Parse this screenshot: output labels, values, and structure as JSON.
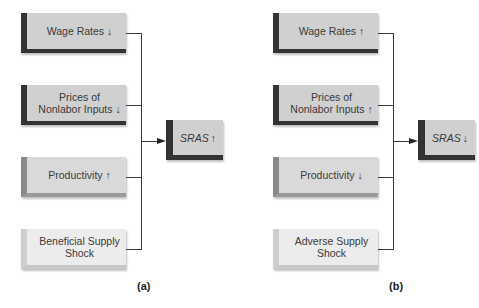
{
  "panel_a": {
    "label": "(a)",
    "factors": [
      {
        "text": "Wage Rates ↓"
      },
      {
        "text": "Prices of Nonlabor Inputs ↓"
      },
      {
        "text": "Productivity ↑"
      },
      {
        "text": "Beneficial Supply Shock"
      }
    ],
    "result": {
      "text": "SRAS",
      "direction": "↑"
    }
  },
  "panel_b": {
    "label": "(b)",
    "factors": [
      {
        "text": "Wage Rates ↑"
      },
      {
        "text": "Prices of Nonlabor Inputs ↑"
      },
      {
        "text": "Productivity ↓"
      },
      {
        "text": "Adverse Supply Shock"
      }
    ],
    "result": {
      "text": "SRAS",
      "direction": "↓"
    }
  },
  "colors": {
    "dark_accent": "#333333",
    "mid_accent": "#8a8a8a",
    "light_accent": "#cfcfcf",
    "box_fill": "#d0d0d0",
    "light_fill": "#ececec",
    "line": "#3a3a3a"
  }
}
